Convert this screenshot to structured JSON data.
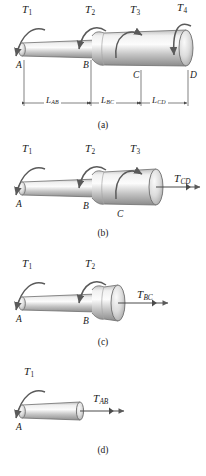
{
  "figure": {
    "title_semantics": "stepped-shaft-torsion-free-body-diagrams",
    "colors": {
      "shaft_light": "#f2f2f2",
      "shaft_mid": "#c9c9c9",
      "shaft_dark": "#9a9a9a",
      "outline": "#6e6e6e",
      "arrow": "#5a5a5a",
      "text": "#1a1a1a"
    }
  },
  "panels": [
    {
      "id": "a",
      "caption": "(a)",
      "torque_labels": [
        {
          "base": "T",
          "sub": "1"
        },
        {
          "base": "T",
          "sub": "2"
        },
        {
          "base": "T",
          "sub": "3"
        },
        {
          "base": "T",
          "sub": "4"
        }
      ],
      "point_labels": [
        "A",
        "B",
        "C",
        "D"
      ],
      "dimension_labels": [
        {
          "base": "L",
          "sub": "AB"
        },
        {
          "base": "L",
          "sub": "BC"
        },
        {
          "base": "L",
          "sub": "CD"
        }
      ]
    },
    {
      "id": "b",
      "caption": "(b)",
      "torque_labels": [
        {
          "base": "T",
          "sub": "1"
        },
        {
          "base": "T",
          "sub": "2"
        },
        {
          "base": "T",
          "sub": "3"
        }
      ],
      "internal_torque": {
        "base": "T",
        "sub": "CD"
      },
      "point_labels": [
        "A",
        "B",
        "C"
      ]
    },
    {
      "id": "c",
      "caption": "(c)",
      "torque_labels": [
        {
          "base": "T",
          "sub": "1"
        },
        {
          "base": "T",
          "sub": "2"
        }
      ],
      "internal_torque": {
        "base": "T",
        "sub": "BC"
      },
      "point_labels": [
        "A",
        "B"
      ]
    },
    {
      "id": "d",
      "caption": "(d)",
      "torque_labels": [
        {
          "base": "T",
          "sub": "1"
        }
      ],
      "internal_torque": {
        "base": "T",
        "sub": "AB"
      },
      "point_labels": [
        "A"
      ]
    }
  ]
}
